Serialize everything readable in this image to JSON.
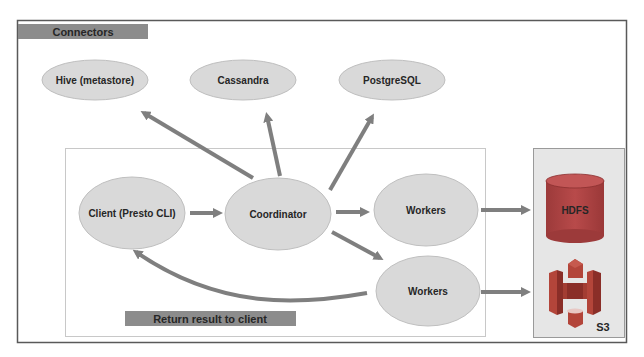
{
  "title_bar": {
    "label": "Connectors"
  },
  "connectors": [
    {
      "id": "hive",
      "label": "Hive (metastore)"
    },
    {
      "id": "cassandra",
      "label": "Cassandra"
    },
    {
      "id": "postgresql",
      "label": "PostgreSQL"
    }
  ],
  "cluster": {
    "client": {
      "label": "Client (Presto CLI)"
    },
    "coordinator": {
      "label": "Coordinator"
    },
    "workers": [
      {
        "label": "Workers"
      },
      {
        "label": "Workers"
      }
    ],
    "return_label": "Return result to client"
  },
  "storage": {
    "hdfs": {
      "label": "HDFS",
      "icon": "database-cylinder-icon"
    },
    "s3": {
      "label": "S3",
      "icon": "aws-s3-icon"
    }
  },
  "colors": {
    "node_fill": "#d9d9d9",
    "node_stroke": "#bfbfbf",
    "arrow": "#7f7f7f",
    "label_bar": "#8c8c8c",
    "hdfs": "#b04444",
    "s3_primary": "#b3453a",
    "s3_dark": "#8a2e28",
    "storage_panel": "#e6e6e6"
  },
  "edges": [
    {
      "from": "client",
      "to": "coordinator"
    },
    {
      "from": "coordinator",
      "to": "hive"
    },
    {
      "from": "coordinator",
      "to": "cassandra"
    },
    {
      "from": "coordinator",
      "to": "postgresql"
    },
    {
      "from": "coordinator",
      "to": "workers-1"
    },
    {
      "from": "coordinator",
      "to": "workers-2"
    },
    {
      "from": "workers-1",
      "to": "hdfs"
    },
    {
      "from": "workers-2",
      "to": "s3"
    },
    {
      "from": "workers-2",
      "to": "client",
      "label": "Return result to client"
    }
  ]
}
